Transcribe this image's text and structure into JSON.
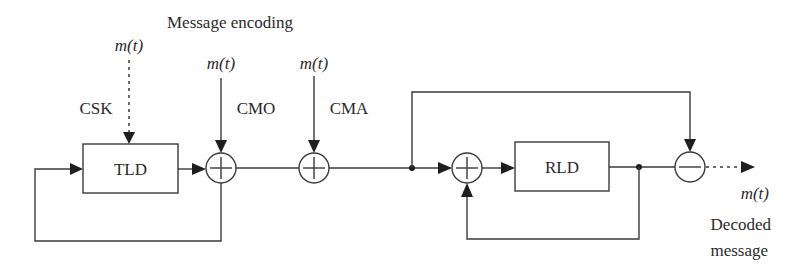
{
  "diagram": {
    "title": "Message encoding",
    "colors": {
      "line": "#3a3a3a",
      "arrowhead": "#1e1e1e",
      "text": "#2a2a2a",
      "background": "#ffffff"
    },
    "inputs": {
      "csk": {
        "signal": "m(t)",
        "label": "CSK",
        "style": "dashed"
      },
      "cmo": {
        "signal": "m(t)",
        "label": "CMO",
        "style": "solid"
      },
      "cma": {
        "signal": "m(t)",
        "label": "CMA",
        "style": "solid"
      }
    },
    "blocks": {
      "transmitter": {
        "label": "TLD"
      },
      "receiver": {
        "label": "RLD"
      }
    },
    "nodes": {
      "adder_cmo": {
        "symbol": "+"
      },
      "adder_cma": {
        "symbol": "+"
      },
      "adder_receiver": {
        "symbol": "+"
      },
      "subtractor": {
        "symbol": "−"
      }
    },
    "output": {
      "signal": "m(t)",
      "label_line1": "Decoded",
      "label_line2": "message"
    }
  }
}
